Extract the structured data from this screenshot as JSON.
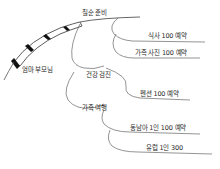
{
  "diagram": {
    "type": "mind-map",
    "style": "hand-drawn",
    "colors": {
      "line": "#555555",
      "pencil_dark": "#111111",
      "pencil_light": "#ffffff",
      "text": "#2a2a2a"
    },
    "root": {
      "label": "엄마 부모님"
    },
    "branches": [
      {
        "label": "칠순 준비",
        "children": [
          {
            "label": "식사 100 예약"
          },
          {
            "label": "가족 사진 100 예약"
          }
        ]
      },
      {
        "label": "건강 검진",
        "children": []
      },
      {
        "label": "가족 여행",
        "children": [
          {
            "label": "펜션 100 예약"
          },
          {
            "label": "동남아 1인 100 예약"
          },
          {
            "label": "유럽 1인 300"
          }
        ]
      }
    ]
  }
}
